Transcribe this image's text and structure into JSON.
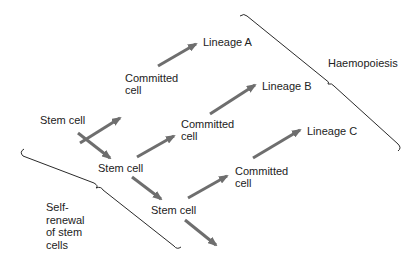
{
  "diagram": {
    "colors": {
      "arrow": "#6e6e6e",
      "brace": "#2a2a2a",
      "text": "#222222",
      "background": "#ffffff"
    },
    "labels": {
      "stem_cell_1": "Stem cell",
      "stem_cell_2": "Stem cell",
      "stem_cell_3": "Stem cell",
      "committed_cell_1": "Committed\ncell",
      "committed_cell_2": "Committed\ncell",
      "committed_cell_3": "Committed\ncell",
      "lineage_a": "Lineage A",
      "lineage_b": "Lineage B",
      "lineage_c": "Lineage C",
      "haemopoiesis": "Haemopoiesis",
      "self_renewal": "Self-\nrenewal\nof stem\ncells"
    },
    "arrows": [
      {
        "from": "stem_cell_1",
        "to": "committed_cell_1"
      },
      {
        "from": "committed_cell_1",
        "to": "lineage_a"
      },
      {
        "from": "stem_cell_1",
        "to": "stem_cell_2"
      },
      {
        "from": "stem_cell_2",
        "to": "committed_cell_2"
      },
      {
        "from": "committed_cell_2",
        "to": "lineage_b"
      },
      {
        "from": "stem_cell_2",
        "to": "stem_cell_3"
      },
      {
        "from": "stem_cell_3",
        "to": "committed_cell_3"
      },
      {
        "from": "committed_cell_3",
        "to": "lineage_c"
      },
      {
        "from": "stem_cell_3",
        "to": "continuation"
      }
    ],
    "braces": [
      {
        "id": "haemopoiesis-brace",
        "label": "haemopoiesis"
      },
      {
        "id": "self-renewal-brace",
        "label": "self_renewal"
      }
    ]
  }
}
